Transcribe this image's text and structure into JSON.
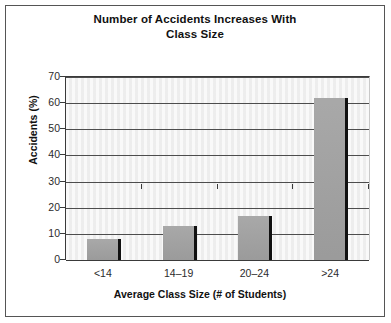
{
  "chart_data": {
    "type": "bar",
    "title": "Number of Accidents Increases With Class Size",
    "title_line1": "Number of Accidents Increases With",
    "title_line2": "Class Size",
    "categories": [
      "<14",
      "14–19",
      "20–24",
      ">24"
    ],
    "values": [
      8,
      13,
      17,
      62
    ],
    "xlabel": "Average Class Size (# of Students)",
    "ylabel": "Accidents (%)",
    "ylim": [
      0,
      70
    ],
    "ytick_values": [
      0,
      10,
      20,
      30,
      40,
      50,
      60,
      70
    ],
    "ytick_labels": [
      "0",
      "10",
      "20",
      "30",
      "40",
      "50",
      "60",
      "70"
    ],
    "grid": true,
    "grid_axis": "y",
    "legend": false,
    "series": [
      {
        "name": "Accidents (%)",
        "values": [
          8,
          13,
          17,
          62
        ],
        "bar_color": "#a3a3a3",
        "edge_color": "#111111"
      }
    ],
    "plot_background": "#f2f2f2",
    "figure_background": "#ffffff",
    "border_color": "#555555",
    "axis_color": "#3a3a3a"
  }
}
